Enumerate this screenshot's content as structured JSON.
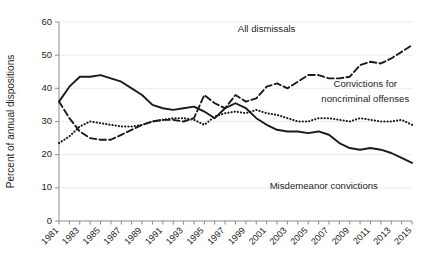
{
  "chart_data": {
    "type": "line",
    "title": "",
    "xlabel": "",
    "ylabel": "Percent of annual dispositions",
    "ylim": [
      0,
      60
    ],
    "ytick_values": [
      0,
      10,
      20,
      30,
      40,
      50,
      60
    ],
    "ytick_labels": [
      "0",
      "10",
      "20",
      "30",
      "40",
      "50",
      "60"
    ],
    "grid": true,
    "grid_axis": "y",
    "legend_position": "inline-annotations",
    "x": [
      1981,
      1982,
      1983,
      1984,
      1985,
      1986,
      1987,
      1988,
      1989,
      1990,
      1991,
      1992,
      1993,
      1994,
      1995,
      1996,
      1997,
      1998,
      1999,
      2000,
      2001,
      2002,
      2003,
      2004,
      2005,
      2006,
      2007,
      2008,
      2009,
      2010,
      2011,
      2012,
      2013,
      2014,
      2015
    ],
    "xtick_labels": [
      "1981",
      "1983",
      "1985",
      "1987",
      "1989",
      "1991",
      "1993",
      "1995",
      "1997",
      "1999",
      "2001",
      "2003",
      "2005",
      "2007",
      "2009",
      "2011",
      "2013",
      "2015"
    ],
    "xtick_values": [
      1981,
      1983,
      1985,
      1987,
      1989,
      1991,
      1993,
      1995,
      1997,
      1999,
      2001,
      2003,
      2005,
      2007,
      2009,
      2011,
      2013,
      2015
    ],
    "series": [
      {
        "name": "Misdemeanor convictions",
        "style": "solid",
        "color": "#1a1a1a",
        "label_x": 2007,
        "label_y": 9,
        "values": [
          36.0,
          40.5,
          43.5,
          43.5,
          44.0,
          43.0,
          42.0,
          40.0,
          38.0,
          35.0,
          34.0,
          33.5,
          34.0,
          34.5,
          33.0,
          31.0,
          34.0,
          35.5,
          34.0,
          31.0,
          29.0,
          27.5,
          27.0,
          27.0,
          26.5,
          27.0,
          26.0,
          23.5,
          22.0,
          21.5,
          22.0,
          21.5,
          20.5,
          19.0,
          17.5
        ]
      },
      {
        "name": "All dismissals",
        "style": "dashed",
        "color": "#1a1a1a",
        "label_x": 2001,
        "label_y": 57,
        "values": [
          36.0,
          31.0,
          27.0,
          25.0,
          24.5,
          24.5,
          26.0,
          27.5,
          29.0,
          30.0,
          30.5,
          30.5,
          30.0,
          31.0,
          38.0,
          35.5,
          34.0,
          38.0,
          36.0,
          37.0,
          40.5,
          41.5,
          40.0,
          42.0,
          44.0,
          44.0,
          43.0,
          43.0,
          43.5,
          47.0,
          48.0,
          47.5,
          49.0,
          51.0,
          53.0
        ]
      },
      {
        "name": "Convictions for noncriminal offenses",
        "style": "dotted",
        "color": "#1a1a1a",
        "label_x": 2010,
        "label_y": 39,
        "values": [
          23.5,
          25.5,
          28.5,
          30.0,
          29.5,
          29.0,
          28.5,
          28.5,
          29.0,
          30.0,
          30.5,
          31.0,
          31.0,
          30.5,
          29.0,
          31.5,
          32.5,
          33.0,
          32.5,
          33.5,
          32.5,
          32.0,
          31.0,
          30.0,
          30.0,
          31.0,
          31.0,
          30.5,
          30.0,
          31.0,
          30.5,
          30.0,
          30.0,
          30.5,
          29.0
        ]
      }
    ],
    "annotations": [
      {
        "text": "All dismissals",
        "x": 2001,
        "y": 57,
        "align": "middle"
      },
      {
        "text": "Convictions for",
        "x": 2010.5,
        "y": 40.5,
        "align": "middle"
      },
      {
        "text": "noncriminal offenses",
        "x": 2010.5,
        "y": 36.0,
        "align": "middle"
      },
      {
        "text": "Misdemeanor convictions",
        "x": 2006.5,
        "y": 9.5,
        "align": "middle"
      }
    ]
  }
}
